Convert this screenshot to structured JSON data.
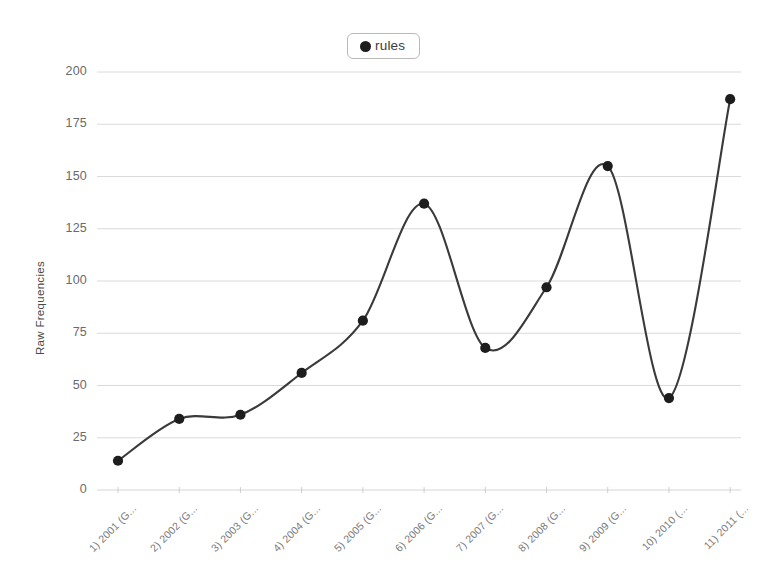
{
  "chart_data": {
    "type": "line",
    "title": "",
    "xlabel": "",
    "ylabel": "Raw Frequencies",
    "ylim": [
      0,
      200
    ],
    "yticks": [
      0,
      25,
      50,
      75,
      100,
      125,
      150,
      175,
      200
    ],
    "grid": true,
    "legend_position": "top-center",
    "marker": "filled-circle",
    "line_color": "#3a3a3a",
    "marker_color": "#1d1d1d",
    "grid_color": "#d6d6d6",
    "categories": [
      "1) 2001 (G...",
      "2) 2002 (G...",
      "3) 2003 (G...",
      "4) 2004 (G...",
      "5) 2005 (G...",
      "6) 2006 (G...",
      "7) 2007 (G...",
      "8) 2008 (G...",
      "9) 2009 (G...",
      "10) 2010 (...",
      "11) 2011 (..."
    ],
    "series": [
      {
        "name": "rules",
        "values": [
          14,
          34,
          36,
          56,
          81,
          137,
          68,
          97,
          155,
          44,
          187
        ]
      }
    ]
  },
  "legend": {
    "items": [
      {
        "label": "rules",
        "marker": "filled-circle"
      }
    ]
  },
  "axes": {
    "y_title": "Raw Frequencies",
    "y_tick_labels": [
      "200",
      "175",
      "150",
      "125",
      "100",
      "75",
      "50",
      "25",
      "0"
    ],
    "x_tick_labels": [
      "1) 2001 (G...",
      "2) 2002 (G...",
      "3) 2003 (G...",
      "4) 2004 (G...",
      "5) 2005 (G...",
      "6) 2006 (G...",
      "7) 2007 (G...",
      "8) 2008 (G...",
      "9) 2009 (G...",
      "10) 2010 (...",
      "11) 2011 (..."
    ]
  }
}
